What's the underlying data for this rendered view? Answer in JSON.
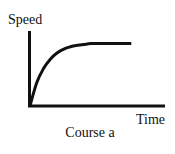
{
  "chart_data": {
    "type": "line",
    "title": "Course a",
    "xlabel": "Time",
    "ylabel": "Speed",
    "xlim": [
      0,
      1
    ],
    "ylim": [
      0,
      1
    ],
    "grid": false,
    "legend": "none",
    "ticks": false,
    "series": [
      {
        "name": "Course a",
        "description": "Speed rises quickly from zero then levels off to a constant plateau",
        "x": [
          0,
          0.05,
          0.1,
          0.15,
          0.2,
          0.25,
          0.3,
          0.35,
          0.4,
          0.45,
          0.5,
          0.55,
          0.6,
          0.65,
          0.7,
          0.75
        ],
        "y": [
          0,
          0.3,
          0.48,
          0.6,
          0.68,
          0.73,
          0.76,
          0.78,
          0.79,
          0.8,
          0.8,
          0.8,
          0.8,
          0.8,
          0.8,
          0.8
        ]
      }
    ],
    "color": "#111111"
  }
}
